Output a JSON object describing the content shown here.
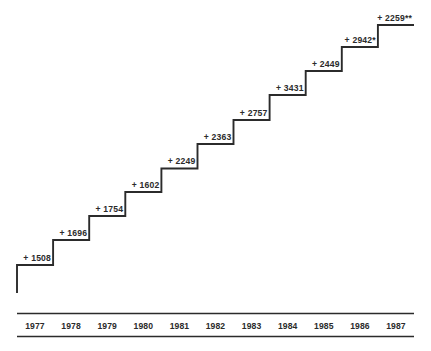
{
  "chart_data": {
    "type": "bar",
    "title": "",
    "subtitle": "",
    "xlabel": "",
    "ylabel": "",
    "grid": false,
    "legend": "none",
    "categories": [
      "1977",
      "1978",
      "1979",
      "1980",
      "1981",
      "1982",
      "1983",
      "1984",
      "1985",
      "1986",
      "1987"
    ],
    "values": [
      1508,
      1696,
      1754,
      1602,
      2249,
      2363,
      2757,
      3431,
      2449,
      2942,
      2259
    ],
    "data_labels": [
      "+ 1508",
      "+ 1696",
      "+ 1754",
      "+ 1602",
      "+ 2249",
      "+ 2363",
      "+ 2757",
      "+ 3431",
      "+ 2449",
      "+ 2942*",
      "+ 2259**"
    ],
    "cumulative": [
      1508,
      3204,
      4958,
      6560,
      8809,
      11172,
      13929,
      17360,
      19809,
      22751,
      25010
    ],
    "annotations": [
      "*",
      "**"
    ],
    "xlim": [
      1977,
      1987
    ],
    "ylim": [
      0,
      25010
    ]
  },
  "axis": {
    "years": [
      "1977",
      "1978",
      "1979",
      "1980",
      "1981",
      "1982",
      "1983",
      "1984",
      "1985",
      "1986",
      "1987"
    ]
  },
  "colors": {
    "line": "#2b2b2b",
    "text": "#2b2b2b",
    "background": "#ffffff"
  }
}
